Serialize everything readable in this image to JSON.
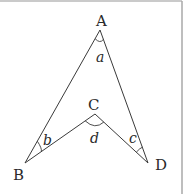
{
  "diagram": {
    "type": "geometry-figure",
    "colors": {
      "stroke": "#3a3a3a",
      "text": "#2a2a2a",
      "border": "#b0b0b0",
      "background": "#ffffff"
    },
    "vertices": {
      "A": {
        "label": "A",
        "x": 100,
        "y": 30
      },
      "B": {
        "label": "B",
        "x": 25,
        "y": 163
      },
      "C": {
        "label": "C",
        "x": 95,
        "y": 114
      },
      "D": {
        "label": "D",
        "x": 148,
        "y": 163
      }
    },
    "segments": [
      "AB",
      "BC",
      "CD",
      "DA"
    ],
    "angles": {
      "a": {
        "label": "a",
        "at": "A"
      },
      "b": {
        "label": "b",
        "at": "B"
      },
      "c": {
        "label": "c",
        "at": "D"
      },
      "d": {
        "label": "d",
        "at": "C"
      }
    }
  }
}
